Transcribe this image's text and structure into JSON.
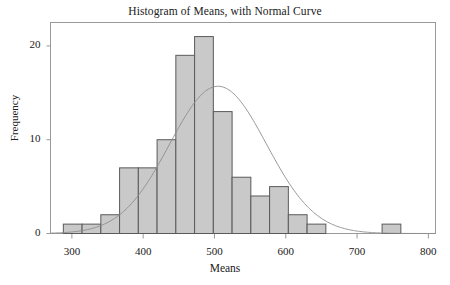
{
  "chart_data": {
    "type": "bar",
    "title": "Histogram of Means, with Normal Curve",
    "xlabel": "Means",
    "ylabel": "Frequency",
    "xlim": [
      270,
      810
    ],
    "ylim": [
      0,
      22.5
    ],
    "xticks": [
      300,
      400,
      500,
      600,
      700,
      800
    ],
    "yticks": [
      0,
      10,
      20
    ],
    "xtick_labels": [
      "300",
      "400",
      "500",
      "600",
      "700",
      "800"
    ],
    "ytick_labels": [
      "0",
      "10",
      "20"
    ],
    "grid": false,
    "legend": null,
    "bin_width": 26.3,
    "bin_edges": [
      288.0,
      314.3,
      340.6,
      366.9,
      393.2,
      419.5,
      445.8,
      472.1,
      498.4,
      524.7,
      551.0,
      577.3,
      603.6,
      629.9,
      656.2,
      682.5,
      708.8,
      735.1,
      761.4
    ],
    "bin_centers": [
      301.2,
      327.5,
      353.8,
      380.1,
      406.4,
      432.7,
      459.0,
      485.3,
      511.6,
      537.9,
      564.2,
      590.5,
      616.8,
      643.1,
      669.4,
      695.7,
      722.0,
      748.3
    ],
    "values": [
      1,
      1,
      2,
      7,
      7,
      10,
      19,
      21,
      13,
      6,
      4,
      5,
      2,
      1,
      0,
      0,
      0,
      1
    ],
    "bar_fill_color": "#c9c9c9",
    "bar_edge_color": "#5a5a5a",
    "curve": {
      "label": "Normal Curve",
      "color": "#8c8c8c",
      "mean": 505,
      "sd": 68,
      "peak_frequency": 15.7
    },
    "frame_color": "#9a9a9a",
    "background_color": "#ffffff"
  }
}
